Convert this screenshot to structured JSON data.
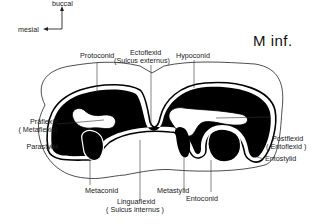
{
  "title": "M inf.",
  "orientation": {
    "up_label": "buccal",
    "left_label": "mesial"
  },
  "labels": {
    "protoconid": "Protoconid",
    "ectoflexid": "Ectoflexid",
    "sulcus_externus": "(Sulcus externus)",
    "hypoconid": "Hypoconid",
    "praflexid": "Präflexid",
    "metaflexid": "( Metaflexid)",
    "parastylid": "Parastylid",
    "postflexid": "Postflexid",
    "entoflexid": "( Entoflexid )",
    "entostylid": "Entostylid",
    "metaconid": "Metaconid",
    "linguaflexid": "Linguaflexid",
    "sulcus_internus": "( Sulcus internus )",
    "metastylid": "Metastylid",
    "entoconid": "Entoconid"
  },
  "colors": {
    "enamel": "#000000",
    "line": "#222222",
    "background": "#ffffff"
  }
}
